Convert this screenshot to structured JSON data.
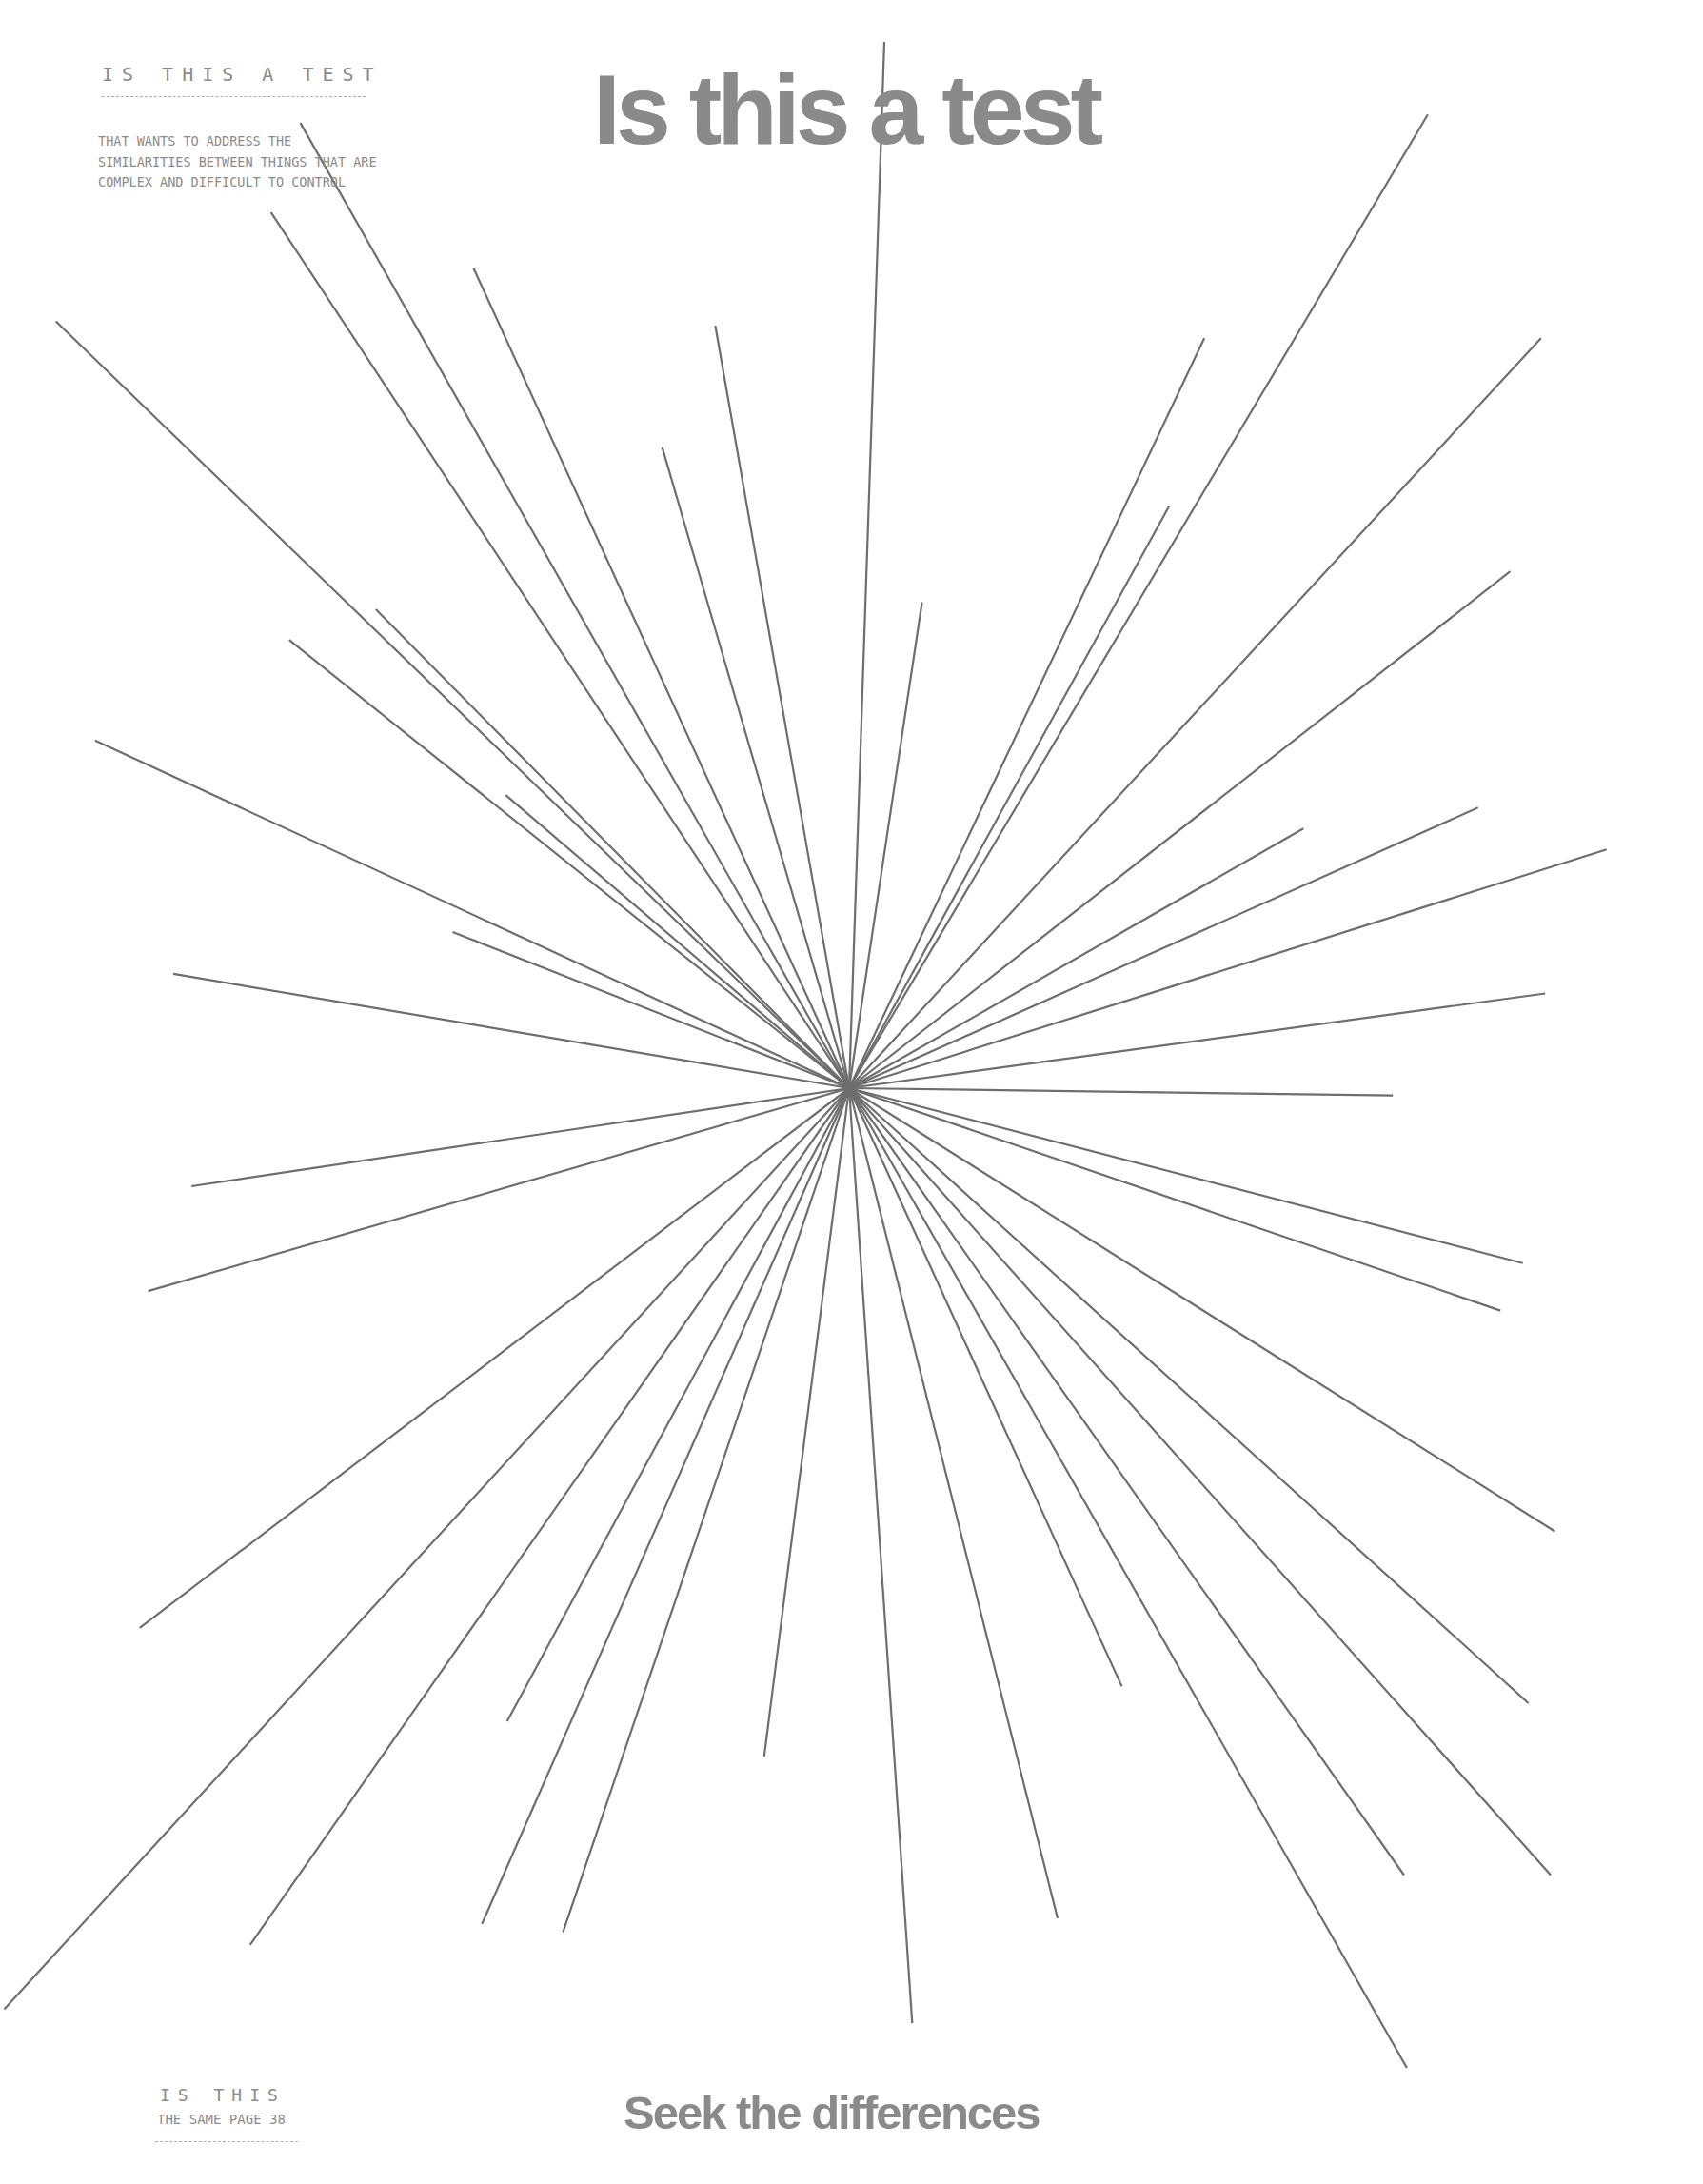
{
  "header": {
    "label": "IS THIS A TEST",
    "body": "THAT WANTS TO ADDRESS THE SIMILARITIES BETWEEN THINGS THAT ARE COMPLEX AND DIFFICULT TO CONTROL",
    "title": "Is this a test"
  },
  "footer": {
    "label": "IS THIS",
    "page_line": "THE SAME PAGE 38",
    "subtitle": "Seek the differences"
  },
  "colors": {
    "text_gray": "#8a8a8a",
    "line_gray": "#6e6e6e",
    "background": "#ffffff"
  },
  "starburst": {
    "center": [
      892,
      1143
    ],
    "scale": 1.4676,
    "preview_center": [
      608,
      779
    ],
    "endpoints_preview": [
      [
        633,
        30
      ],
      [
        1022,
        82
      ],
      [
        1103,
        242
      ],
      [
        862,
        242
      ],
      [
        837,
        362
      ],
      [
        660,
        431
      ],
      [
        512,
        233
      ],
      [
        474,
        320
      ],
      [
        339,
        192
      ],
      [
        215,
        88
      ],
      [
        194,
        152
      ],
      [
        40,
        230
      ],
      [
        269,
        436
      ],
      [
        207,
        458
      ],
      [
        362,
        569
      ],
      [
        68,
        530
      ],
      [
        324,
        667
      ],
      [
        124,
        697
      ],
      [
        1081,
        409
      ],
      [
        933,
        593
      ],
      [
        1058,
        578
      ],
      [
        1150,
        608
      ],
      [
        1106,
        711
      ],
      [
        997,
        784
      ],
      [
        137,
        849
      ],
      [
        106,
        924
      ],
      [
        1090,
        904
      ],
      [
        1074,
        938
      ],
      [
        1113,
        1096
      ],
      [
        1094,
        1219
      ],
      [
        1110,
        1342
      ],
      [
        1005,
        1342
      ],
      [
        1007,
        1480
      ],
      [
        803,
        1207
      ],
      [
        757,
        1373
      ],
      [
        653,
        1448
      ],
      [
        547,
        1257
      ],
      [
        403,
        1383
      ],
      [
        345,
        1377
      ],
      [
        363,
        1232
      ],
      [
        179,
        1392
      ],
      [
        100,
        1165
      ],
      [
        3,
        1438
      ]
    ]
  }
}
